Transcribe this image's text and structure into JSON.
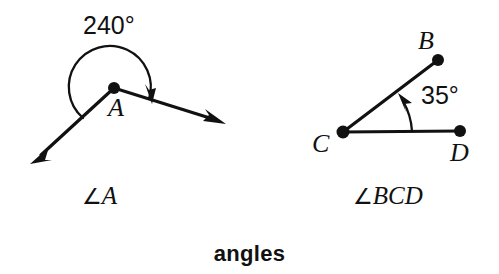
{
  "figure": {
    "caption": "angles",
    "background_color": "#ffffff",
    "stroke_color": "#111111"
  },
  "diagrams": [
    {
      "id": "angle-a",
      "name": "reflex-angle-a",
      "label": "∠A",
      "label_symbol": "∠",
      "label_text": "A",
      "measure": "240°",
      "measure_value": 240,
      "measure_unit": "degrees",
      "arc_direction": "clockwise-reflex",
      "vertex": {
        "name": "A",
        "label": "A",
        "x": 114,
        "y": 88
      },
      "rays": [
        {
          "name": "ray-a-left",
          "from": "A",
          "tip_x": 32,
          "tip_y": 162,
          "arrowhead": true
        },
        {
          "name": "ray-a-right",
          "from": "A",
          "tip_x": 224,
          "tip_y": 123,
          "arrowhead": true
        }
      ]
    },
    {
      "id": "angle-bcd",
      "name": "acute-angle-bcd",
      "label": "∠BCD",
      "label_symbol": "∠",
      "label_text": "BCD",
      "measure": "35°",
      "measure_value": 35,
      "measure_unit": "degrees",
      "arc_direction": "counterclockwise",
      "vertex": {
        "name": "C",
        "label": "C",
        "x": 343,
        "y": 132
      },
      "points": [
        {
          "name": "B",
          "label": "B",
          "x": 438,
          "y": 60
        },
        {
          "name": "C",
          "label": "C",
          "x": 343,
          "y": 132
        },
        {
          "name": "D",
          "label": "D",
          "x": 460,
          "y": 131
        }
      ],
      "segments": [
        {
          "name": "segment-cb",
          "from": "C",
          "to": "B"
        },
        {
          "name": "segment-cd",
          "from": "C",
          "to": "D"
        }
      ]
    }
  ]
}
